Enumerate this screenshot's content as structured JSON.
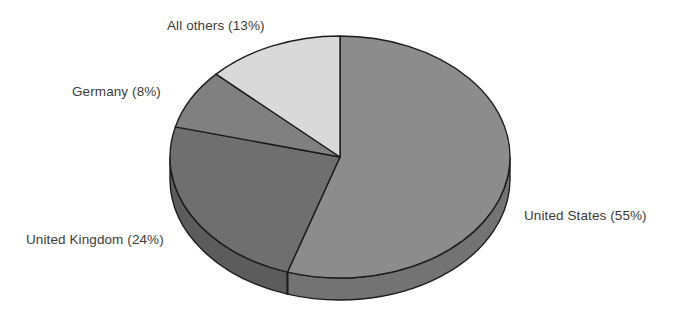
{
  "chart_data": {
    "type": "pie",
    "title": "",
    "subtitle": "",
    "xlabel": "",
    "ylabel": "",
    "grid": false,
    "legend_position": "none",
    "label_format": "{name} ({value}%)",
    "three_d": true,
    "start_angle_deg": 0,
    "direction": "clockwise",
    "categories": [
      "United States",
      "United Kingdom",
      "Germany",
      "All others"
    ],
    "values": [
      55,
      24,
      8,
      13
    ],
    "units": "percent",
    "total": 100,
    "slices": [
      {
        "name": "United States",
        "value": 55,
        "label": "United States (55%)",
        "color": "#8c8c8c",
        "side_color": "#737373",
        "start_deg": 0,
        "end_deg": 198
      },
      {
        "name": "United Kingdom",
        "value": 24,
        "label": "United Kingdom (24%)",
        "color": "#6f6f6f",
        "side_color": "#5c5c5c",
        "start_deg": 198,
        "end_deg": 284.4
      },
      {
        "name": "Germany",
        "value": 8,
        "label": "Germany (8%)",
        "color": "#808080",
        "side_color": "#6a6a6a",
        "start_deg": 284.4,
        "end_deg": 313.2
      },
      {
        "name": "All others",
        "value": 13,
        "label": "All others (13%)",
        "color": "#d9d9d9",
        "side_color": "#b8b8b8",
        "start_deg": 313.2,
        "end_deg": 360
      }
    ],
    "labels": [
      "All others (13%)",
      "Germany (8%)",
      "United Kingdom (24%)",
      "United States (55%)"
    ]
  },
  "style": {
    "background": "#ffffff",
    "outline_color": "#1c1c1c",
    "label_color": "#3b3b3b"
  }
}
